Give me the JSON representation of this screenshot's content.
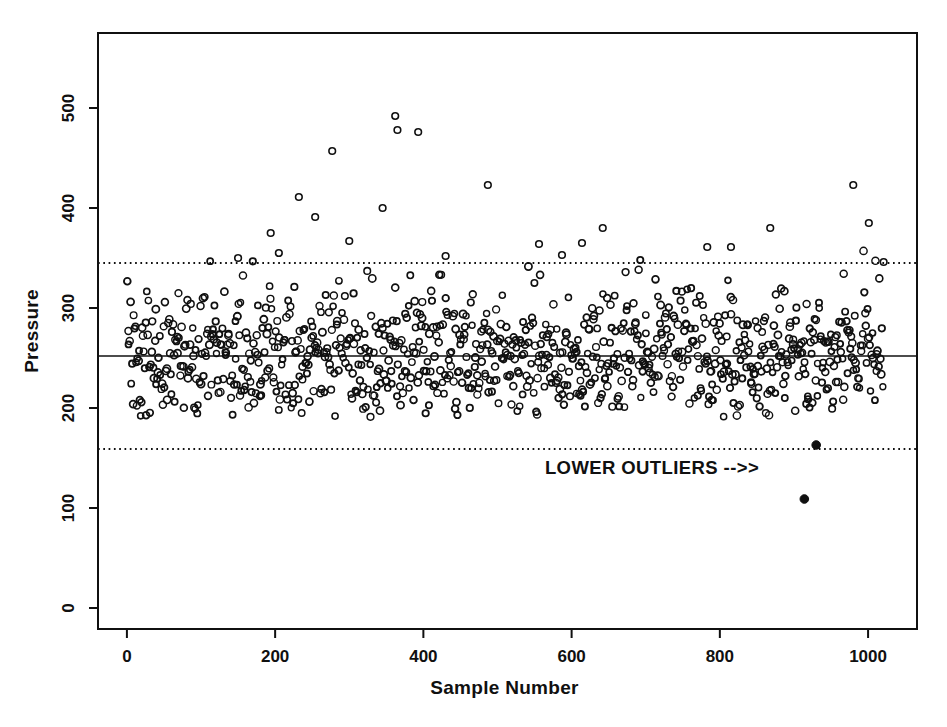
{
  "page": {
    "background": "#ffffff",
    "ink_color": "#101010"
  },
  "chart_data": {
    "type": "scatter",
    "title": "",
    "xlabel": "Sample Number",
    "ylabel": "Pressure",
    "x_ticks": [
      0,
      200,
      400,
      600,
      800,
      1000
    ],
    "y_ticks": [
      0,
      100,
      200,
      300,
      400,
      500
    ],
    "xlim": [
      -39,
      1066
    ],
    "ylim": [
      -21,
      575
    ],
    "grid": false,
    "legend": "none",
    "center_line": {
      "y": 252,
      "style": "solid"
    },
    "upper_limit_line": {
      "y": 345,
      "style": "dotted"
    },
    "lower_limit_line": {
      "y": 159,
      "style": "dotted"
    },
    "annotation": {
      "text": "LOWER OUTLIERS -->>",
      "x": 564,
      "y": 140,
      "align": "left"
    },
    "lower_outliers": {
      "marker": "filled-circle",
      "points": [
        [
          930,
          163
        ],
        [
          914,
          109
        ]
      ]
    },
    "upper_points": [
      [
        150,
        350
      ],
      [
        194,
        375
      ],
      [
        205,
        355
      ],
      [
        232,
        411
      ],
      [
        254,
        391
      ],
      [
        277,
        457
      ],
      [
        300,
        367
      ],
      [
        345,
        400
      ],
      [
        362,
        492
      ],
      [
        365,
        478
      ],
      [
        393,
        476
      ],
      [
        430,
        352
      ],
      [
        487,
        423
      ],
      [
        556,
        364
      ],
      [
        587,
        353
      ],
      [
        614,
        365
      ],
      [
        642,
        380
      ],
      [
        783,
        361
      ],
      [
        815,
        361
      ],
      [
        868,
        380
      ],
      [
        980,
        423
      ],
      [
        1001,
        385
      ],
      [
        1021,
        346
      ]
    ],
    "bulk_points": {
      "distribution": "normal",
      "n": 960,
      "seed": 20240613,
      "x_min": 0,
      "x_max": 1020,
      "y_mean": 248,
      "y_sd": 36,
      "y_clip_min": 191,
      "y_clip_max": 374
    },
    "marker": {
      "shape": "open-circle",
      "radius_px": 3.3,
      "stroke_px": 1.6,
      "color": "#101010"
    },
    "outlier_marker": {
      "shape": "filled-circle",
      "radius_px": 4.3,
      "color": "#101010"
    }
  }
}
